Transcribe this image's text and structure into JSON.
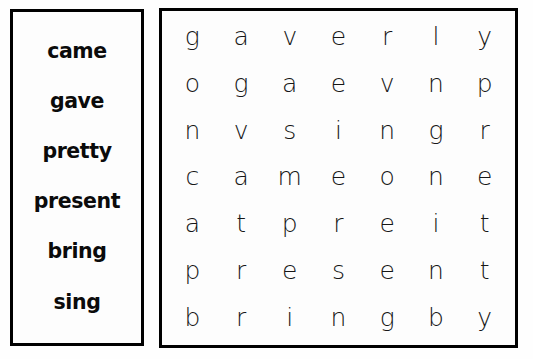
{
  "worksheet": {
    "type": "word-search-puzzle",
    "grid_size": "7x7",
    "colors": {
      "ink": "#0b0b0b",
      "grid_letter": "#161616",
      "border": "#000000",
      "background": "#fefefe"
    }
  },
  "word_bank": {
    "words": [
      "came",
      "gave",
      "pretty",
      "present",
      "bring",
      "sing"
    ]
  },
  "letter_grid": {
    "rows": [
      [
        "g",
        "a",
        "v",
        "e",
        "r",
        "l",
        "y"
      ],
      [
        "o",
        "g",
        "a",
        "e",
        "v",
        "n",
        "p"
      ],
      [
        "n",
        "v",
        "s",
        "i",
        "n",
        "g",
        "r"
      ],
      [
        "c",
        "a",
        "m",
        "e",
        "o",
        "n",
        "e"
      ],
      [
        "a",
        "t",
        "p",
        "r",
        "e",
        "i",
        "t"
      ],
      [
        "p",
        "r",
        "e",
        "s",
        "e",
        "n",
        "t"
      ],
      [
        "b",
        "r",
        "i",
        "n",
        "g",
        "b",
        "y"
      ]
    ]
  }
}
